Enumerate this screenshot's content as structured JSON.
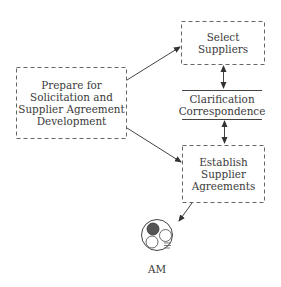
{
  "diagram": {
    "nodes": {
      "prepare": {
        "lines": [
          "Prepare for",
          "Solicitation and",
          "Supplier Agreement",
          "Development"
        ],
        "shape": "dashed-rectangle"
      },
      "select": {
        "lines": [
          "Select",
          "Suppliers"
        ],
        "shape": "dashed-rectangle"
      },
      "clarification": {
        "lines": [
          "Clarification",
          "Correspondence"
        ],
        "shape": "data-store (top and bottom rules)"
      },
      "establish": {
        "lines": [
          "Establish",
          "Supplier",
          "Agreements"
        ],
        "shape": "dashed-rectangle"
      },
      "am": {
        "label": "AM",
        "shape": "circle-icon"
      }
    },
    "edges": [
      {
        "from": "prepare",
        "to": "select",
        "type": "arrow"
      },
      {
        "from": "prepare",
        "to": "establish",
        "type": "arrow"
      },
      {
        "from": "select",
        "to": "clarification",
        "type": "double-arrow"
      },
      {
        "from": "clarification",
        "to": "establish",
        "type": "double-arrow"
      },
      {
        "from": "establish",
        "to": "am",
        "type": "arrow"
      }
    ],
    "colors": {
      "stroke": "#555555",
      "text": "#3a3a3a",
      "am_fill": "#555555"
    }
  }
}
